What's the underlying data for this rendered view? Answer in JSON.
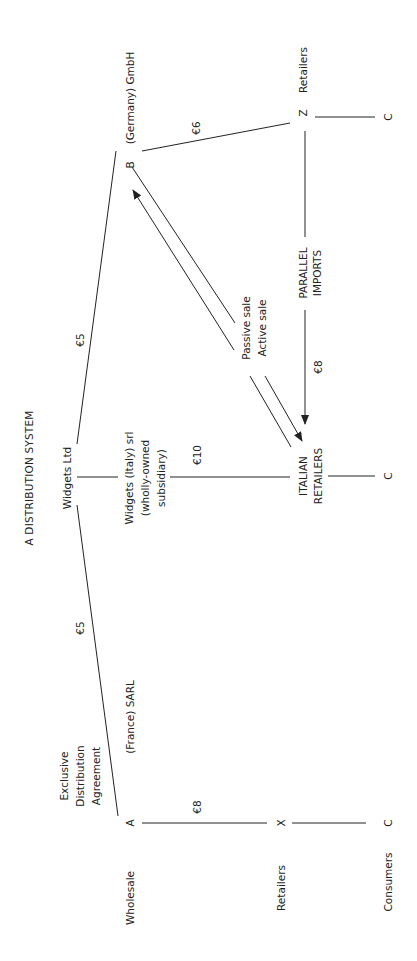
{
  "title": "A DISTRIBUTION SYSTEM",
  "colors": {
    "ink": "#222222",
    "background": "#ffffff"
  },
  "nodes": {
    "widgets_ltd": "Widgets Ltd",
    "germany_letter": "B",
    "germany_label": "(Germany) GmbH",
    "france_letter": "A",
    "france_label": "(France) SARL",
    "italy_sub_line1": "Widgets (Italy) srl",
    "italy_sub_line2": "(wholly-owned",
    "italy_sub_line3": "subsidiary)",
    "italian_retailers_line1": "ITALIAN",
    "italian_retailers_line2": "RETAILERS",
    "z_letter": "Z",
    "z_label": "Retailers",
    "x_letter": "X",
    "c_top": "C",
    "c_mid": "C",
    "c_bottom": "C"
  },
  "edges": {
    "ltd_to_b_price": "€5",
    "ltd_to_a_price": "€5",
    "b_to_z_price": "€6",
    "a_to_x_price": "€8",
    "italy_to_retailers_price": "€10",
    "parallel_price": "€8",
    "parallel_line1": "PARALLEL",
    "parallel_line2": "IMPORTS",
    "passive_sale": "Passive sale",
    "active_sale": "Active sale",
    "exclusive_line1": "Exclusive",
    "exclusive_line2": "Distribution",
    "exclusive_line3": "Agreement"
  },
  "row_labels": {
    "wholesale": "Wholesale",
    "retailers": "Retailers",
    "consumers": "Consumers"
  }
}
